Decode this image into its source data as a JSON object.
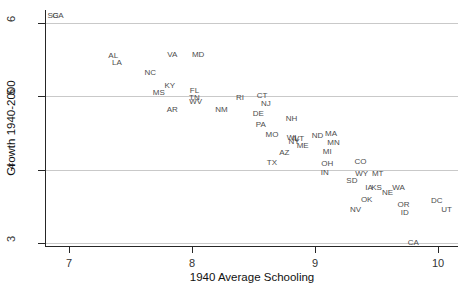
{
  "figure": {
    "xlabel": "1940 Average Schooling",
    "ylabel": "Growth 1940-2000"
  },
  "colors": {
    "background": "#ffffff",
    "axis": "#262626",
    "gridline": "#c9c9c9",
    "tick_label": "#333333",
    "point_label": "#4d4d4d"
  },
  "chart_data": {
    "type": "scatter",
    "marker": "state-abbreviation-text",
    "title": "",
    "xlabel": "1940 Average Schooling",
    "ylabel": "Growth 1940-2000",
    "xlim": [
      6.8,
      10.15
    ],
    "ylim": [
      2.95,
      6.15
    ],
    "xticks": [
      7,
      8,
      9,
      10
    ],
    "yticks": [
      3,
      4,
      5,
      6
    ],
    "grid": "horizontal-only",
    "legend": "none",
    "points": [
      {
        "label": "SC",
        "x": 6.87,
        "y": 6.1
      },
      {
        "label": "GA",
        "x": 6.91,
        "y": 6.1
      },
      {
        "label": "AL",
        "x": 7.36,
        "y": 5.56
      },
      {
        "label": "LA",
        "x": 7.39,
        "y": 5.47
      },
      {
        "label": "VA",
        "x": 7.84,
        "y": 5.57
      },
      {
        "label": "MD",
        "x": 8.05,
        "y": 5.57
      },
      {
        "label": "NC",
        "x": 7.66,
        "y": 5.33
      },
      {
        "label": "KY",
        "x": 7.82,
        "y": 5.15
      },
      {
        "label": "MS",
        "x": 7.73,
        "y": 5.05
      },
      {
        "label": "FL",
        "x": 8.02,
        "y": 5.08
      },
      {
        "label": "TN",
        "x": 8.02,
        "y": 4.99
      },
      {
        "label": "WV",
        "x": 8.03,
        "y": 4.94
      },
      {
        "label": "AR",
        "x": 7.84,
        "y": 4.83
      },
      {
        "label": "NM",
        "x": 8.24,
        "y": 4.83
      },
      {
        "label": "RI",
        "x": 8.39,
        "y": 4.99
      },
      {
        "label": "CT",
        "x": 8.57,
        "y": 5.02
      },
      {
        "label": "NJ",
        "x": 8.6,
        "y": 4.91
      },
      {
        "label": "DE",
        "x": 8.54,
        "y": 4.77
      },
      {
        "label": "NH",
        "x": 8.81,
        "y": 4.7
      },
      {
        "label": "PA",
        "x": 8.56,
        "y": 4.62
      },
      {
        "label": "MO",
        "x": 8.65,
        "y": 4.49
      },
      {
        "label": "WI",
        "x": 8.81,
        "y": 4.45
      },
      {
        "label": "VT",
        "x": 8.87,
        "y": 4.43
      },
      {
        "label": "IL",
        "x": 8.84,
        "y": 4.43
      },
      {
        "label": "NY",
        "x": 8.83,
        "y": 4.39
      },
      {
        "label": "ME",
        "x": 8.9,
        "y": 4.33
      },
      {
        "label": "ND",
        "x": 9.02,
        "y": 4.47
      },
      {
        "label": "MA",
        "x": 9.13,
        "y": 4.5
      },
      {
        "label": "MN",
        "x": 9.15,
        "y": 4.38
      },
      {
        "label": "AZ",
        "x": 8.75,
        "y": 4.24
      },
      {
        "label": "MI",
        "x": 9.1,
        "y": 4.25
      },
      {
        "label": "TX",
        "x": 8.65,
        "y": 4.1
      },
      {
        "label": "OH",
        "x": 9.1,
        "y": 4.09
      },
      {
        "label": "IN",
        "x": 9.08,
        "y": 3.97
      },
      {
        "label": "CO",
        "x": 9.37,
        "y": 4.12
      },
      {
        "label": "WY",
        "x": 9.38,
        "y": 3.96
      },
      {
        "label": "MT",
        "x": 9.51,
        "y": 3.96
      },
      {
        "label": "SD",
        "x": 9.3,
        "y": 3.86
      },
      {
        "label": "IA",
        "x": 9.44,
        "y": 3.77
      },
      {
        "label": "KS",
        "x": 9.5,
        "y": 3.77
      },
      {
        "label": "NE",
        "x": 9.59,
        "y": 3.7
      },
      {
        "label": "WA",
        "x": 9.68,
        "y": 3.77
      },
      {
        "label": "OK",
        "x": 9.42,
        "y": 3.6
      },
      {
        "label": "NV",
        "x": 9.33,
        "y": 3.47
      },
      {
        "label": "OR",
        "x": 9.72,
        "y": 3.53
      },
      {
        "label": "ID",
        "x": 9.73,
        "y": 3.42
      },
      {
        "label": "DC",
        "x": 9.99,
        "y": 3.59
      },
      {
        "label": "UT",
        "x": 10.07,
        "y": 3.47
      },
      {
        "label": "CA",
        "x": 9.8,
        "y": 3.02
      }
    ]
  }
}
